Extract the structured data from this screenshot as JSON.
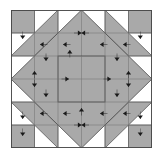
{
  "figure": {
    "kind": "quilt-block-piecing-diagram",
    "title": "",
    "width_px": 163,
    "height_px": 156
  },
  "canvas": {
    "background": "#ffffff",
    "block_origin_x": 11,
    "block_origin_y": 10,
    "block_width": 141,
    "block_height": 138,
    "grid_cols": 6,
    "grid_rows": 6,
    "cell_w": 23.5,
    "cell_h": 23.0
  },
  "colors": {
    "fabric_light": "#ffffff",
    "fabric_medium": "#a9a9a9",
    "seam_line": "#6e6e6e",
    "outline": "#4a4a4a",
    "arrow": "#1a1a1a"
  },
  "shapes": {
    "corner_squares": [
      {
        "name": "corner-square-top-left",
        "x": 0,
        "y": 0,
        "w": 23.5,
        "h": 23
      },
      {
        "name": "corner-square-top-right",
        "x": 117.5,
        "y": 0,
        "w": 23.5,
        "h": 23
      },
      {
        "name": "corner-square-bottom-left",
        "x": 0,
        "y": 115,
        "w": 23.5,
        "h": 23
      },
      {
        "name": "corner-square-bottom-right",
        "x": 117.5,
        "y": 115,
        "w": 23.5,
        "h": 23
      }
    ],
    "center_square": {
      "name": "center-square",
      "x": 47,
      "y": 46,
      "w": 47,
      "h": 46
    },
    "diamond_ring": {
      "name": "diamond-ring",
      "outer_points": "70.5,0 141,69 70.5,138 0,69",
      "inner_points": "70.5,46 94,69 70.5,92 47,69"
    },
    "diagonal_bands": [
      {
        "name": "diagonal-band-top-left",
        "points": "23.5,46 47,23 47,0 0,46"
      },
      {
        "name": "diagonal-band-top-right",
        "points": "117.5,46 94,23 94,0 141,46"
      },
      {
        "name": "diagonal-band-bottom-left",
        "points": "23.5,92 47,115 47,138 0,92"
      },
      {
        "name": "diagonal-band-bottom-right",
        "points": "117.5,92 94,115 94,138 141,92"
      }
    ]
  },
  "grid_lines": {
    "vertical_x": [
      23.5,
      47,
      70.5,
      94,
      117.5
    ],
    "horizontal_y": [
      23,
      46,
      69,
      92,
      115
    ]
  },
  "arrows": [
    {
      "name": "arrow-marker",
      "x": 11.7,
      "y": 29,
      "dir": "down"
    },
    {
      "name": "arrow-marker",
      "x": 29,
      "y": 34.5,
      "dir": "left"
    },
    {
      "name": "arrow-marker",
      "x": 52,
      "y": 34.5,
      "dir": "left"
    },
    {
      "name": "arrow-marker",
      "x": 70.5,
      "y": 23,
      "dir": "left"
    },
    {
      "name": "arrow-marker",
      "x": 70.5,
      "y": 23,
      "dir": "right"
    },
    {
      "name": "arrow-marker",
      "x": 89,
      "y": 34.5,
      "dir": "left"
    },
    {
      "name": "arrow-marker",
      "x": 112,
      "y": 34.5,
      "dir": "left"
    },
    {
      "name": "arrow-marker",
      "x": 129.3,
      "y": 29,
      "dir": "down"
    },
    {
      "name": "arrow-marker",
      "x": 58.8,
      "y": 40,
      "dir": "up"
    },
    {
      "name": "arrow-marker",
      "x": 35,
      "y": 51,
      "dir": "down"
    },
    {
      "name": "arrow-marker",
      "x": 106,
      "y": 51,
      "dir": "down"
    },
    {
      "name": "arrow-marker",
      "x": 23.5,
      "y": 61,
      "dir": "up"
    },
    {
      "name": "arrow-marker",
      "x": 23.5,
      "y": 77,
      "dir": "down"
    },
    {
      "name": "arrow-marker",
      "x": 117.5,
      "y": 61,
      "dir": "up"
    },
    {
      "name": "arrow-marker",
      "x": 117.5,
      "y": 77,
      "dir": "down"
    },
    {
      "name": "arrow-marker",
      "x": 58,
      "y": 69,
      "dir": "right"
    },
    {
      "name": "arrow-marker",
      "x": 100,
      "y": 69,
      "dir": "right"
    },
    {
      "name": "arrow-marker",
      "x": 70.5,
      "y": 98,
      "dir": "up"
    },
    {
      "name": "arrow-marker",
      "x": 35,
      "y": 87,
      "dir": "down"
    },
    {
      "name": "arrow-marker",
      "x": 106,
      "y": 87,
      "dir": "down"
    },
    {
      "name": "arrow-marker",
      "x": 11.7,
      "y": 109,
      "dir": "down"
    },
    {
      "name": "arrow-marker",
      "x": 29,
      "y": 103.5,
      "dir": "left"
    },
    {
      "name": "arrow-marker",
      "x": 52,
      "y": 103.5,
      "dir": "left"
    },
    {
      "name": "arrow-marker",
      "x": 89,
      "y": 103.5,
      "dir": "left"
    },
    {
      "name": "arrow-marker",
      "x": 112,
      "y": 103.5,
      "dir": "left"
    },
    {
      "name": "arrow-marker",
      "x": 129.3,
      "y": 109,
      "dir": "down"
    },
    {
      "name": "arrow-marker",
      "x": 11.7,
      "y": 126,
      "dir": "down"
    },
    {
      "name": "arrow-marker",
      "x": 129.3,
      "y": 126,
      "dir": "down"
    },
    {
      "name": "arrow-marker",
      "x": 70.5,
      "y": 115,
      "dir": "left"
    },
    {
      "name": "arrow-marker",
      "x": 70.5,
      "y": 115,
      "dir": "right"
    }
  ]
}
